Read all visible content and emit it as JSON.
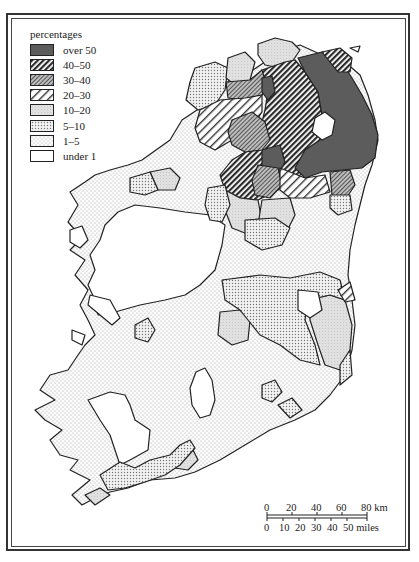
{
  "legend": {
    "title": "percentages",
    "items": [
      {
        "label": "over 50",
        "pattern": "solid-dark"
      },
      {
        "label": "40–50",
        "pattern": "dense-hatch"
      },
      {
        "label": "30–40",
        "pattern": "cross-grey"
      },
      {
        "label": "20–30",
        "pattern": "wide-hatch"
      },
      {
        "label": "10–20",
        "pattern": "light-grey"
      },
      {
        "label": "5–10",
        "pattern": "dense-dots"
      },
      {
        "label": "1–5",
        "pattern": "sparse-dots"
      },
      {
        "label": "under 1",
        "pattern": "blank"
      }
    ]
  },
  "scale": {
    "km_ticks": [
      "0",
      "20",
      "40",
      "60",
      "80 km"
    ],
    "mile_ticks": [
      "0",
      "10",
      "20",
      "30",
      "40",
      "50 miles"
    ]
  },
  "colors": {
    "ink": "#222222",
    "dark": "#5a5a5a",
    "grey": "#b9b9b9",
    "light": "#dcdcdc",
    "paper": "#ffffff"
  }
}
